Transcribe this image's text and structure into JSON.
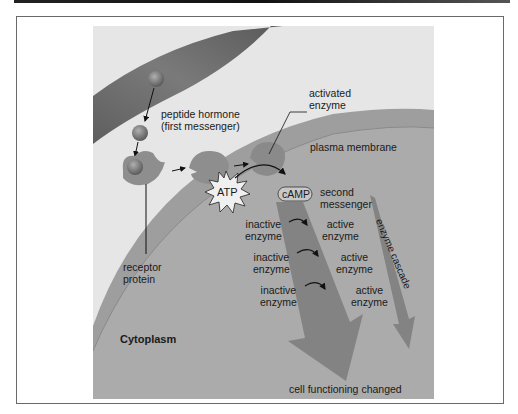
{
  "figure": {
    "labels": {
      "peptide_hormone": [
        "peptide hormone",
        "(first messenger)"
      ],
      "activated_enzyme": [
        "activated",
        "enzyme"
      ],
      "plasma_membrane": "plasma membrane",
      "atp": "ATP",
      "camp": "cAMP",
      "second_messenger": [
        "second",
        "messenger"
      ],
      "receptor_protein": [
        "receptor",
        "protein"
      ],
      "cytoplasm": "Cytoplasm",
      "enzyme_cascade": "enzyme cascade",
      "cell_functioning": "cell functioning changed",
      "cascade_steps": [
        {
          "inactive": [
            "inactive",
            "enzyme"
          ],
          "active": [
            "active",
            "enzyme"
          ]
        },
        {
          "inactive": [
            "inactive",
            "enzyme"
          ],
          "active": [
            "active",
            "enzyme"
          ]
        },
        {
          "inactive": [
            "inactive",
            "enzyme"
          ],
          "active": [
            "active",
            "enzyme"
          ]
        }
      ]
    },
    "colors": {
      "background": "#e6e6e6",
      "cytoplasm": "#a9a9a9",
      "membrane_band": "#9c9c9c",
      "blood_vessel": "#6e6e6e",
      "hormone": "#7a7a7a",
      "receptor": "#8e8e8e",
      "cascade_arrow": "#7e7e7e"
    }
  }
}
